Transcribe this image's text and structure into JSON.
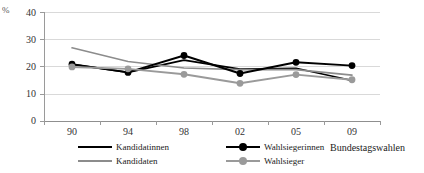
{
  "chart_data": {
    "type": "line",
    "title": "",
    "xlabel": "Bundestagswahlen",
    "ylabel": "%",
    "categories": [
      "90",
      "94",
      "98",
      "02",
      "05",
      "09"
    ],
    "ylim": [
      0,
      40
    ],
    "yticks": [
      0,
      10,
      20,
      30,
      40
    ],
    "grid": true,
    "legend_position": "bottom",
    "series": [
      {
        "name": "Kandidatinnen",
        "color": "#000000",
        "marker": "none",
        "values": [
          21.0,
          18.0,
          22.5,
          19.2,
          19.5,
          15.0
        ]
      },
      {
        "name": "Kandidaten",
        "color": "#8c8c8c",
        "marker": "none",
        "values": [
          27.0,
          22.0,
          19.6,
          19.0,
          19.0,
          17.0
        ]
      },
      {
        "name": "Wahlsiegerinnen",
        "color": "#000000",
        "marker": "circle",
        "values": [
          21.0,
          18.0,
          24.2,
          17.6,
          21.7,
          20.5
        ]
      },
      {
        "name": "Wahlsieger",
        "color": "#9a9a9a",
        "marker": "circle",
        "values": [
          20.0,
          19.3,
          17.3,
          14.0,
          17.2,
          15.3
        ]
      }
    ]
  },
  "axis": {
    "unit_label": "%",
    "y_tick_labels": [
      "40",
      "30",
      "20",
      "10",
      "0"
    ],
    "x_tick_labels": [
      "90",
      "94",
      "98",
      "02",
      "05",
      "09"
    ],
    "x_axis_title": "Bundestagswahlen"
  },
  "legend": {
    "items": [
      {
        "label": "Kandidatinnen",
        "color": "#000000",
        "marker": false
      },
      {
        "label": "Kandidaten",
        "color": "#8c8c8c",
        "marker": false
      },
      {
        "label": "Wahlsiegerinnen",
        "color": "#000000",
        "marker": true
      },
      {
        "label": "Wahlsieger",
        "color": "#9a9a9a",
        "marker": true
      }
    ]
  },
  "colors": {
    "black_series": "#000000",
    "gray_series": "#8c8c8c",
    "gridline": "#d9d9d9",
    "axis": "#8f8f8f",
    "background": "#ffffff"
  }
}
